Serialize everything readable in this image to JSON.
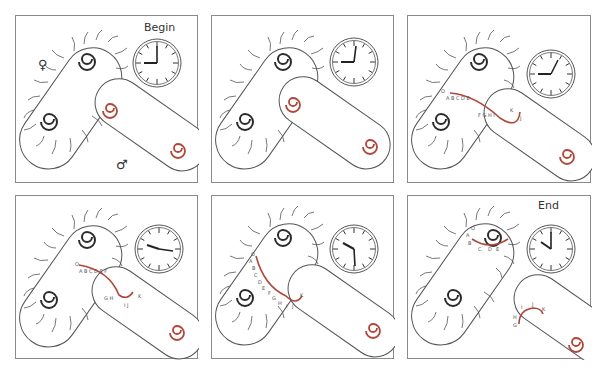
{
  "colors": {
    "border": "#8a8a8a",
    "cell_outline": "#555555",
    "female_chromosome": "#2b2b2b",
    "male_chromosome": "#b0473a",
    "transferred_dna": "#b0473a",
    "gene_label": "#555555"
  },
  "symbols": {
    "female": "♀",
    "male": "♂"
  },
  "panels": [
    {
      "id": 1,
      "caption": "Begin",
      "clock": {
        "hour_deg": 90,
        "minute_deg": 0
      },
      "stage": "separate",
      "genes_donor": [],
      "genes_recipient": []
    },
    {
      "id": 2,
      "caption": "",
      "clock": {
        "hour_deg": 270,
        "minute_deg": 10
      },
      "stage": "contact",
      "genes_donor": [],
      "genes_recipient": []
    },
    {
      "id": 3,
      "caption": "",
      "clock": {
        "hour_deg": 270,
        "minute_deg": 30
      },
      "stage": "transfer-early",
      "genes_text": [
        "O",
        "A",
        "B",
        "C",
        "D",
        "E",
        "F",
        "G",
        "H",
        "I",
        "J",
        "K"
      ]
    },
    {
      "id": 4,
      "caption": "",
      "clock": {
        "hour_deg": 285,
        "minute_deg": 95
      },
      "stage": "transfer-mid",
      "genes_text": [
        "O",
        "A",
        "B",
        "C",
        "D",
        "E",
        "F",
        "G",
        "H",
        "I",
        "J",
        "K"
      ]
    },
    {
      "id": 5,
      "caption": "",
      "clock": {
        "hour_deg": 305,
        "minute_deg": 165
      },
      "stage": "transfer-late",
      "genes_text": [
        "O",
        "A",
        "B",
        "C",
        "D",
        "E",
        "F",
        "G",
        "H",
        "I",
        "J",
        "K"
      ]
    },
    {
      "id": 6,
      "caption": "End",
      "clock": {
        "hour_deg": 300,
        "minute_deg": 0
      },
      "stage": "separated",
      "genes_female": [
        "O",
        "A",
        "B",
        "C",
        "D",
        "E"
      ],
      "genes_male": [
        "G",
        "H",
        "I",
        "J",
        "K"
      ]
    }
  ]
}
